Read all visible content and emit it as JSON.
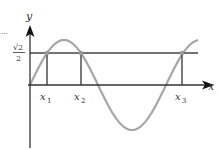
{
  "figure": {
    "type": "sine graph with horizontal line y = sqrt(2)/2",
    "axes": {
      "x_label": "x",
      "y_label": "y"
    },
    "level_line": {
      "label_numerator": "√2",
      "label_denominator": "2"
    },
    "points": [
      {
        "label_base": "x",
        "label_sub": "1"
      },
      {
        "label_base": "x",
        "label_sub": "2"
      },
      {
        "label_base": "x",
        "label_sub": "3"
      }
    ],
    "colors": {
      "axis": "#333333",
      "curve": "#a6a6a6",
      "line": "#444444",
      "point": "#999999"
    },
    "ellipsis": "..."
  }
}
